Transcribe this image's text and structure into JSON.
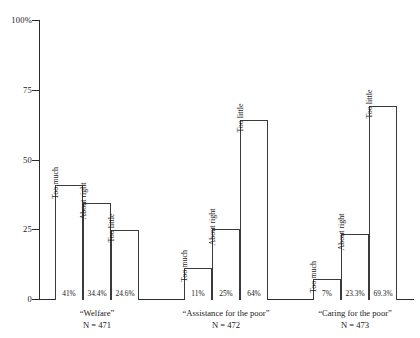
{
  "chart_data": {
    "type": "bar",
    "title": "",
    "subtitle": "",
    "xlabel": "",
    "ylabel": "",
    "ylim": [
      0,
      100
    ],
    "yticks": [
      {
        "value": 100,
        "label": "100%"
      },
      {
        "value": 75,
        "label": "75"
      },
      {
        "value": 50,
        "label": "50"
      },
      {
        "value": 25,
        "label": "25"
      },
      {
        "value": 0,
        "label": "0"
      }
    ],
    "grid": false,
    "legend": "none",
    "categories": [
      "Too much",
      "About right",
      "Too little"
    ],
    "groups": [
      {
        "name": "“Welfare”",
        "n_label": "N = 471",
        "bars": [
          {
            "label": "Too much",
            "value": 41,
            "value_label": "41%"
          },
          {
            "label": "About right",
            "value": 34.4,
            "value_label": "34.4%"
          },
          {
            "label": "Too little",
            "value": 24.6,
            "value_label": "24.6%"
          }
        ]
      },
      {
        "name": "“Assistance for the poor”",
        "n_label": "N = 472",
        "bars": [
          {
            "label": "Too much",
            "value": 11,
            "value_label": "11%"
          },
          {
            "label": "About right",
            "value": 25,
            "value_label": "25%"
          },
          {
            "label": "Too little",
            "value": 64,
            "value_label": "64%"
          }
        ]
      },
      {
        "name": "“Caring for the poor”",
        "n_label": "N = 473",
        "bars": [
          {
            "label": "Too much",
            "value": 7,
            "value_label": "7%"
          },
          {
            "label": "About right",
            "value": 23.3,
            "value_label": "23.3%"
          },
          {
            "label": "Too little",
            "value": 69.3,
            "value_label": "69.3%"
          }
        ]
      }
    ],
    "colors": {
      "bar_fill": "#ffffff",
      "bar_stroke": "#3a3a3a",
      "axis": "#2b2b2b",
      "text": "#1a1a1a",
      "background": "#ffffff"
    }
  },
  "layout": {
    "plot_left": 39,
    "plot_top": 20,
    "plot_bottom": 299,
    "bar_width": 28,
    "group_starts": [
      55,
      184,
      313
    ],
    "bar_gap": 0
  }
}
